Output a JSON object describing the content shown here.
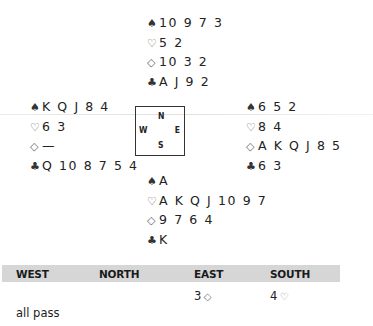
{
  "hands": {
    "north": {
      "spades": "10 9 7 3",
      "hearts": "5 2",
      "diamonds": "10 3 2",
      "clubs": "A J 9 2"
    },
    "west": {
      "spades": "K Q J 8 4",
      "hearts": "6 3",
      "diamonds": "—",
      "clubs": "Q 10 8 7 5 4"
    },
    "east": {
      "spades": "6 5 2",
      "hearts": "8 4",
      "diamonds": "A K Q J 8 5",
      "clubs": "6 3"
    },
    "south": {
      "spades": "A",
      "hearts": "A K Q J 10 9 7",
      "diamonds": "9 7 6 4",
      "clubs": "K"
    }
  },
  "suit_symbols": {
    "spades": "♠",
    "hearts": "♡",
    "diamonds": "◇",
    "clubs": "♣"
  },
  "compass": {
    "n": "N",
    "w": "W",
    "e": "E",
    "s": "S"
  },
  "bidding": {
    "headers": [
      "WEST",
      "NORTH",
      "EAST",
      "SOUTH"
    ],
    "round1": {
      "east_level": "3",
      "south_level": "4"
    },
    "final": "all pass"
  },
  "colors": {
    "bid_bar": "#d6d6d6",
    "text": "#222222"
  }
}
